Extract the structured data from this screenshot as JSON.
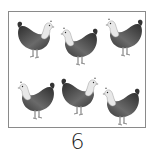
{
  "worksheet": {
    "item": "hen",
    "count_label": "6",
    "hens": [
      {
        "row": 1,
        "col": 1,
        "facing": "right"
      },
      {
        "row": 1,
        "col": 2,
        "facing": "left"
      },
      {
        "row": 1,
        "col": 3,
        "facing": "left"
      },
      {
        "row": 2,
        "col": 1,
        "facing": "left"
      },
      {
        "row": 2,
        "col": 2,
        "facing": "right"
      },
      {
        "row": 2,
        "col": 3,
        "facing": "left"
      }
    ]
  },
  "colors": {
    "border": "#8a8a8a",
    "hen_body": "#4a4a4a",
    "hen_neck": "#e6e6e6",
    "background": "#ffffff"
  }
}
